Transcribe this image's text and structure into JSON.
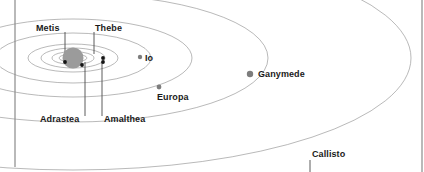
{
  "figure": {
    "type": "orbital-diagram",
    "background_color": "#ffffff",
    "orbit_line_color": "#8a8a8a",
    "planet_color": "#9b9b9b",
    "inner_moon_color": "#141414",
    "outer_moon_color": "#7d7d7d",
    "leader_line_color": "#4a4a4a",
    "axis_line_color": "#8a8a8a",
    "label_color": "#1a1a1a"
  },
  "planet": {
    "name": "Jupiter",
    "cx": 73,
    "cy": 58,
    "r": 10.5
  },
  "axis_lines": [
    {
      "name": "left-vertical-rule",
      "x": 15,
      "y1": 0,
      "y2": 167
    },
    {
      "name": "right-vertical-rule",
      "x": 422,
      "y1": 0,
      "y2": 172
    }
  ],
  "orbits": [
    {
      "name": "metis-orbit",
      "rx": 14,
      "ry": 4
    },
    {
      "name": "adrastea-orbit",
      "rx": 21,
      "ry": 6.5
    },
    {
      "name": "amaltheaorbit",
      "rx": 32,
      "ry": 10
    },
    {
      "name": "thebe-orbit",
      "rx": 45,
      "ry": 14
    },
    {
      "name": "io-orbit",
      "rx": 78,
      "ry": 25
    },
    {
      "name": "europa-orbit",
      "rx": 119,
      "ry": 39
    },
    {
      "name": "ganymede-orbit",
      "rx": 195,
      "ry": 64
    },
    {
      "name": "callisto-orbit",
      "rx": 338,
      "ry": 112
    }
  ],
  "moons": [
    {
      "key": "metis",
      "label": "Metis",
      "dot_x": 65,
      "dot_y": 62,
      "dot_r": 1.9,
      "kind": "inner",
      "leader": {
        "x": 65,
        "y1": 62,
        "y2": 32
      },
      "label_x": 36,
      "label_y": 23,
      "label_anchor": "start"
    },
    {
      "key": "thebe",
      "label": "Thebe",
      "dot_x": 103,
      "dot_y": 58,
      "dot_r": 1.9,
      "kind": "inner",
      "leader": {
        "x": 94,
        "y1": 54,
        "y2": 32
      },
      "label_x": 95,
      "label_y": 23,
      "label_anchor": "start"
    },
    {
      "key": "adrastea",
      "label": "Adrastea",
      "dot_x": 82,
      "dot_y": 65,
      "dot_r": 1.9,
      "kind": "inner",
      "leader": {
        "x": 85,
        "y1": 62,
        "y2": 116
      },
      "label_x": 40,
      "label_y": 114,
      "label_anchor": "start"
    },
    {
      "key": "amalthea",
      "label": "Amalthea",
      "dot_x": 103,
      "dot_y": 62,
      "dot_r": 1.9,
      "kind": "inner",
      "leader": {
        "x": 102,
        "y1": 62,
        "y2": 116
      },
      "label_x": 104,
      "label_y": 114,
      "label_anchor": "start"
    },
    {
      "key": "io",
      "label": "Io",
      "dot_x": 140,
      "dot_y": 57,
      "dot_r": 2.2,
      "kind": "outer",
      "leader": null,
      "label_x": 145,
      "label_y": 53,
      "label_anchor": "start"
    },
    {
      "key": "europa",
      "label": "Europa",
      "dot_x": 159,
      "dot_y": 87,
      "dot_r": 2.4,
      "kind": "outer",
      "leader": null,
      "label_x": 157,
      "label_y": 92,
      "label_anchor": "start"
    },
    {
      "key": "ganymede",
      "label": "Ganymede",
      "dot_x": 250,
      "dot_y": 74,
      "dot_r": 3.2,
      "kind": "outer",
      "leader": null,
      "label_x": 258,
      "label_y": 69,
      "label_anchor": "start"
    },
    {
      "key": "callisto",
      "label": "Callisto",
      "dot_x": null,
      "dot_y": null,
      "dot_r": 0,
      "kind": "outer",
      "leader": {
        "x": 310,
        "y1": 160,
        "y2": 172
      },
      "label_x": 312,
      "label_y": 149,
      "label_anchor": "start"
    }
  ]
}
